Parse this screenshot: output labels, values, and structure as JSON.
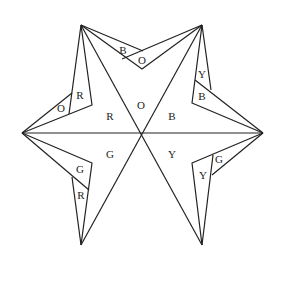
{
  "diagram": {
    "center_labels": {
      "top": "O",
      "upper_left": "R",
      "upper_right": "B",
      "lower_left": "G",
      "lower_right": "Y"
    },
    "flap_labels": {
      "top_left_outer": "B",
      "top_right_outer": "O",
      "right_upper_outer": "Y",
      "right_upper_inner": "B",
      "right_lower_outer": "G",
      "right_lower_inner": "Y",
      "left_upper_outer": "O",
      "left_upper_inner": "R",
      "left_lower_outer": "G",
      "left_lower_inner": "R"
    },
    "colors": {
      "line": "#222222",
      "background": "#ffffff"
    }
  }
}
